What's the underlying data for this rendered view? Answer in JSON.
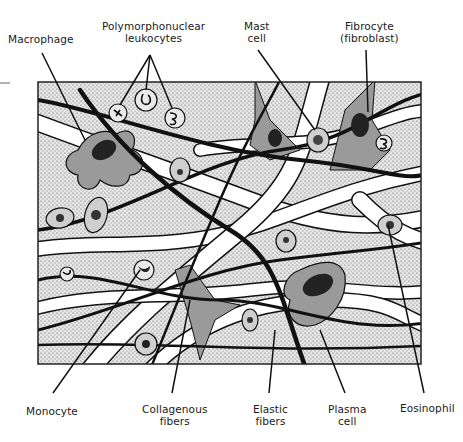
{
  "labels": {
    "macrophage": {
      "lines": [
        "Macrophage"
      ]
    },
    "pmn": {
      "lines": [
        "Polymorphonuclear",
        "leukocytes"
      ]
    },
    "mast": {
      "lines": [
        "Mast",
        "cell"
      ]
    },
    "fibrocyte": {
      "lines": [
        "Fibrocyte",
        "(fibroblast)"
      ]
    },
    "monocyte": {
      "lines": [
        "Monocyte"
      ]
    },
    "collagenous": {
      "lines": [
        "Collagenous",
        "fibers"
      ]
    },
    "elastic": {
      "lines": [
        "Elastic",
        "fibers"
      ]
    },
    "plasma": {
      "lines": [
        "Plasma",
        "cell"
      ]
    },
    "eosinophil": {
      "lines": [
        "Eosinophil"
      ]
    }
  },
  "colors": {
    "ink": "#111111",
    "ground_stipple": "#d9d9d9",
    "cell_gray": "#9a9a9a",
    "fiber_white": "#ffffff"
  }
}
